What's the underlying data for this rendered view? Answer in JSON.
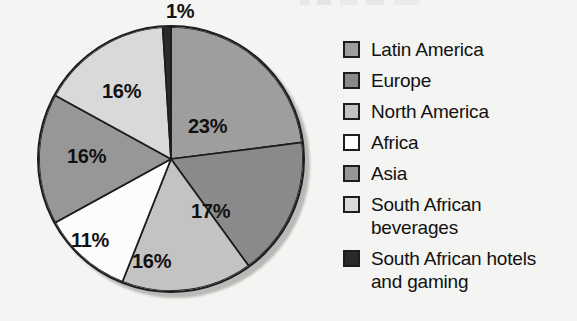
{
  "chart_data": {
    "type": "pie",
    "title": "",
    "categories": [
      "Latin America",
      "Europe",
      "North America",
      "Africa",
      "Asia",
      "South African beverages",
      "South African hotels and gaming"
    ],
    "values": [
      23,
      17,
      16,
      11,
      16,
      16,
      1
    ],
    "value_labels": [
      "23%",
      "17%",
      "16%",
      "11%",
      "16%",
      "16%",
      "1%"
    ],
    "unit": "%",
    "legend_position": "right",
    "grid": false,
    "start_angle_deg": 0,
    "direction": "clockwise",
    "slice_colors": [
      "#9e9e9e",
      "#8a8a8a",
      "#c3c3c3",
      "#fcfcfc",
      "#979797",
      "#d9d9d9",
      "#2a2a2a"
    ],
    "outline_color": "#1c1c1c",
    "background": "#f4f4f2",
    "slices": [
      {
        "label": "Latin America",
        "value": 23,
        "value_label": "23%",
        "color": "#9e9e9e",
        "start_deg": 0,
        "end_deg": 82.8
      },
      {
        "label": "Europe",
        "value": 17,
        "value_label": "17%",
        "color": "#8a8a8a",
        "start_deg": 82.8,
        "end_deg": 144.0
      },
      {
        "label": "North America",
        "value": 16,
        "value_label": "16%",
        "color": "#c3c3c3",
        "start_deg": 144.0,
        "end_deg": 201.6
      },
      {
        "label": "Africa",
        "value": 11,
        "value_label": "11%",
        "color": "#fcfcfc",
        "start_deg": 201.6,
        "end_deg": 241.2
      },
      {
        "label": "Asia",
        "value": 16,
        "value_label": "16%",
        "color": "#979797",
        "start_deg": 241.2,
        "end_deg": 298.8
      },
      {
        "label": "South African beverages",
        "value": 16,
        "value_label": "16%",
        "color": "#d9d9d9",
        "start_deg": 298.8,
        "end_deg": 356.4
      },
      {
        "label": "South African hotels and gaming",
        "value": 1,
        "value_label": "1%",
        "color": "#2a2a2a",
        "start_deg": 356.4,
        "end_deg": 360.0
      }
    ]
  },
  "pie_labels": [
    {
      "text": "23%",
      "name": "pie-label-latin-america"
    },
    {
      "text": "17%",
      "name": "pie-label-europe"
    },
    {
      "text": "16%",
      "name": "pie-label-north-america"
    },
    {
      "text": "11%",
      "name": "pie-label-africa"
    },
    {
      "text": "16%",
      "name": "pie-label-asia"
    },
    {
      "text": "16%",
      "name": "pie-label-south-african-beverages"
    },
    {
      "text": "1%",
      "name": "pie-label-south-african-hotels"
    }
  ],
  "legend": {
    "items": [
      {
        "label": "Latin America",
        "line2": "",
        "color": "#9e9e9e"
      },
      {
        "label": "Europe",
        "line2": "",
        "color": "#8a8a8a"
      },
      {
        "label": "North America",
        "line2": "",
        "color": "#c3c3c3"
      },
      {
        "label": "Africa",
        "line2": "",
        "color": "#fcfcfc"
      },
      {
        "label": "Asia",
        "line2": "",
        "color": "#979797"
      },
      {
        "label": "South African",
        "line2": "beverages",
        "color": "#d9d9d9"
      },
      {
        "label": "South African hotels",
        "line2": "and gaming",
        "color": "#2a2a2a"
      }
    ]
  }
}
